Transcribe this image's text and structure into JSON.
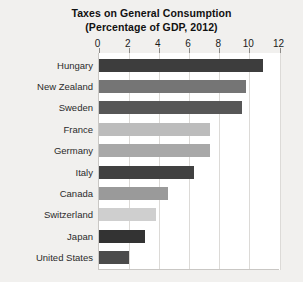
{
  "chart_data": {
    "type": "bar",
    "orientation": "horizontal",
    "title": "Taxes on General Consumption",
    "subtitle": "(Percentage of GDP, 2012)",
    "xlabel": "",
    "ylabel": "",
    "xlim": [
      0,
      12
    ],
    "xticks": [
      0,
      2,
      4,
      6,
      8,
      10,
      12
    ],
    "xtick_labels": [
      "0",
      "2",
      "4",
      "6",
      "8",
      "10",
      "12"
    ],
    "grid": true,
    "grid_axis": "x",
    "legend": false,
    "categories": [
      "Hungary",
      "New Zealand",
      "Sweden",
      "France",
      "Germany",
      "Italy",
      "Canada",
      "Switzerland",
      "Japan",
      "United States"
    ],
    "values": [
      10.9,
      9.8,
      9.5,
      7.4,
      7.4,
      6.3,
      4.6,
      3.8,
      3.1,
      2.0
    ],
    "bar_colors": [
      "#3d3d3d",
      "#757575",
      "#575757",
      "#bcbcbc",
      "#a8a8a8",
      "#414141",
      "#9a9a9a",
      "#cfcfcf",
      "#333333",
      "#4b4b4b"
    ],
    "background_color": "#f1f0ee",
    "plot_background_color": "#ffffff",
    "gridline_color": "#dcdad7"
  }
}
